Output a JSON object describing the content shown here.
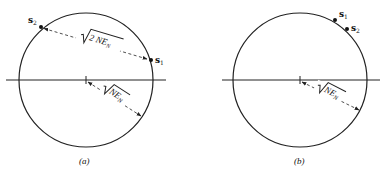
{
  "figure": {
    "panels": [
      {
        "id": "a",
        "caption": "(a)",
        "circle": {
          "cx": 86,
          "cy": 80,
          "r": 67
        },
        "axis": {
          "x1": 6,
          "x2": 166,
          "y": 80
        },
        "points": [
          {
            "name": "s",
            "sub": "2",
            "x": 41,
            "y": 27
          },
          {
            "name": "s",
            "sub": "1",
            "x": 151,
            "y": 60
          }
        ],
        "distance_label": {
          "radicand": "2 NE",
          "sub": "N"
        },
        "radius_label": {
          "radicand": "NE",
          "sub": "N"
        }
      },
      {
        "id": "b",
        "caption": "(b)",
        "circle": {
          "cx": 300,
          "cy": 80,
          "r": 67
        },
        "axis": {
          "x1": 222,
          "x2": 380,
          "y": 80
        },
        "points": [
          {
            "name": "s",
            "sub": "1",
            "x": 335,
            "y": 20
          },
          {
            "name": "s",
            "sub": "2",
            "x": 347,
            "y": 29
          }
        ],
        "radius_label": {
          "radicand": "NE",
          "sub": "N"
        }
      }
    ],
    "colors": {
      "ink": "#222222",
      "background": "#ffffff"
    }
  }
}
